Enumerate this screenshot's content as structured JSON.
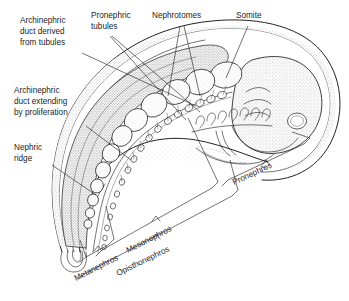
{
  "figure": {
    "background_color": "#ffffff",
    "ink_color": "#1d1d1d",
    "width": 349,
    "height": 301
  },
  "labels": {
    "archinephric_duct_derived": {
      "line1": "Archinephric",
      "line2": "duct derived",
      "line3": "from tubules"
    },
    "archinephric_duct_extending": {
      "line1": "Archinephric",
      "line2": "duct extending",
      "line3": "by proliferation"
    },
    "nephric_ridge": {
      "line1": "Nephric",
      "line2": "ridge"
    },
    "pronephric_tubules": {
      "line1": "Pronephric",
      "line2": "tubules"
    },
    "nephrotomes": {
      "line1": "Nephrotomes"
    },
    "somite": {
      "line1": "Somite"
    }
  },
  "brackets": {
    "metanephros": "Metanephros",
    "mesonephros": "Mesonephros",
    "opisthonephros": "Opisthonephros",
    "pronephros": "Pronephros"
  }
}
